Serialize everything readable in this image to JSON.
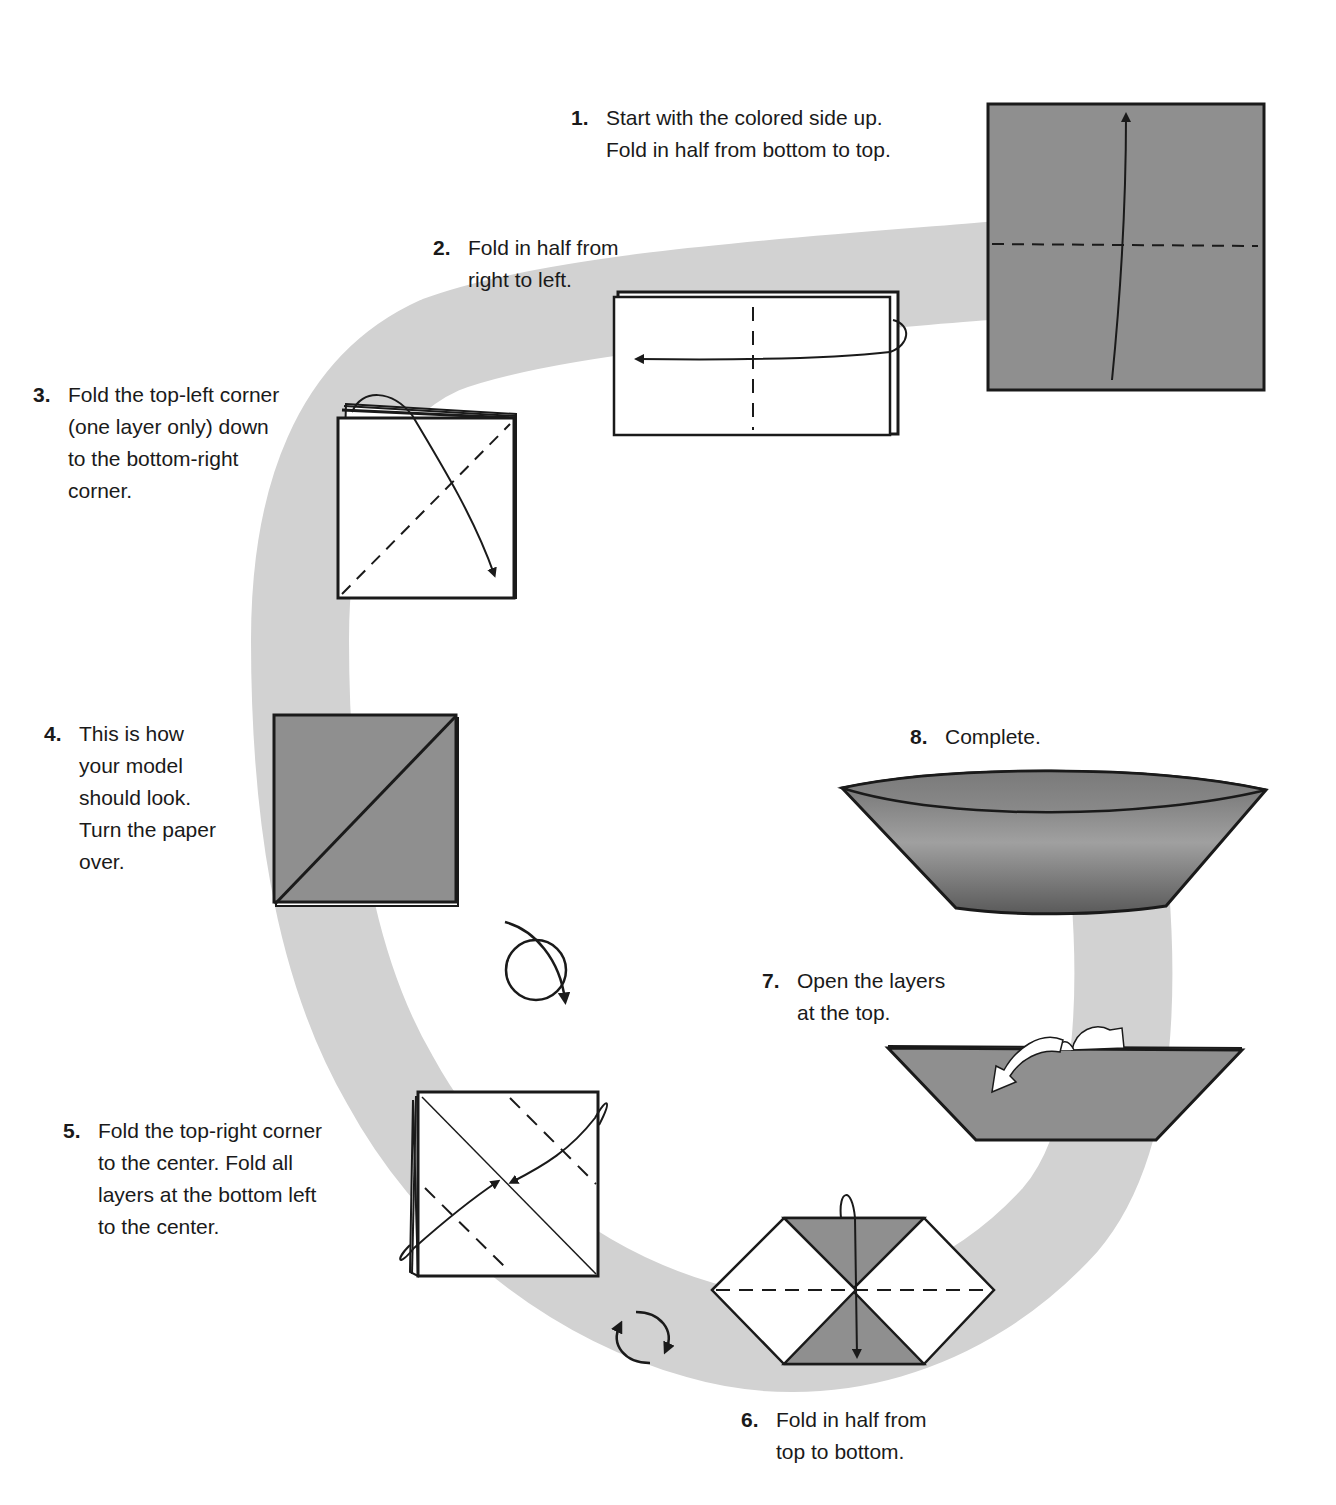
{
  "diagram": {
    "type": "origami-instructions",
    "colors": {
      "band": "#d2d2d2",
      "paper_colored": "#8f8f8f",
      "paper_white": "#ffffff",
      "line": "#1a1a1a"
    },
    "steps": [
      {
        "number": "1.",
        "text": "Start with the colored side up.\nFold in half from bottom to top."
      },
      {
        "number": "2.",
        "text": "Fold in half from\nright to left."
      },
      {
        "number": "3.",
        "text": "Fold the top-left corner\n(one layer only) down\nto the bottom-right\ncorner."
      },
      {
        "number": "4.",
        "text": "This is how\nyour model\nshould look.\nTurn the paper\nover."
      },
      {
        "number": "5.",
        "text": "Fold the top-right corner\nto the center. Fold all\nlayers at the bottom left\nto the center."
      },
      {
        "number": "6.",
        "text": "Fold in half from\ntop to bottom."
      },
      {
        "number": "7.",
        "text": "Open the layers\nat the top."
      },
      {
        "number": "8.",
        "text": "Complete."
      }
    ]
  }
}
